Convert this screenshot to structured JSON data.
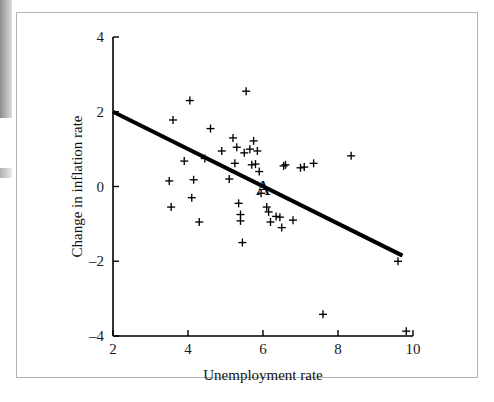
{
  "figure": {
    "background_color": "#ffffff",
    "frame_color": "#b3b3b3",
    "ink_color": "#000000"
  },
  "labels": {
    "x_axis_title": "Unemployment rate",
    "y_axis_title": "Change in inflation rate",
    "annotation_a": "A",
    "x_ticks": [
      "2",
      "4",
      "6",
      "8",
      "10"
    ],
    "y_ticks": [
      "-4",
      "-2",
      "0",
      "2",
      "4"
    ]
  },
  "chart_data": {
    "type": "scatter",
    "title": "",
    "xlabel": "Unemployment rate",
    "ylabel": "Change in inflation rate",
    "xlim": [
      2,
      10
    ],
    "ylim": [
      -4,
      4
    ],
    "xticks": [
      2,
      4,
      6,
      8,
      10
    ],
    "yticks": [
      -4,
      -2,
      0,
      2,
      4
    ],
    "grid": false,
    "legend": "none",
    "marker": "plus",
    "marker_color": "#000000",
    "annotations": [
      {
        "text": "A",
        "x": 6.0,
        "y": -0.05,
        "note": "labelled observation on the fitted line"
      }
    ],
    "fit_line": {
      "label": "Phillips curve (fitted regression line)",
      "color": "#000000",
      "width_px": 4,
      "x_start": 2.0,
      "y_start": 2.0,
      "x_end": 9.72,
      "y_end": -1.85,
      "slope": -0.4987,
      "intercept": 2.9974
    },
    "points": [
      {
        "x": 3.5,
        "y": 0.15
      },
      {
        "x": 3.55,
        "y": -0.55
      },
      {
        "x": 3.6,
        "y": 1.78
      },
      {
        "x": 3.9,
        "y": 0.68
      },
      {
        "x": 4.05,
        "y": 2.3
      },
      {
        "x": 4.1,
        "y": -0.3
      },
      {
        "x": 4.15,
        "y": 0.18
      },
      {
        "x": 4.3,
        "y": -0.95
      },
      {
        "x": 4.45,
        "y": 0.75
      },
      {
        "x": 4.6,
        "y": 1.55
      },
      {
        "x": 4.9,
        "y": 0.95
      },
      {
        "x": 5.1,
        "y": 0.2
      },
      {
        "x": 5.2,
        "y": 1.3
      },
      {
        "x": 5.25,
        "y": 0.62
      },
      {
        "x": 5.3,
        "y": 1.05
      },
      {
        "x": 5.35,
        "y": -0.45
      },
      {
        "x": 5.4,
        "y": -0.75
      },
      {
        "x": 5.4,
        "y": -0.92
      },
      {
        "x": 5.45,
        "y": -1.5
      },
      {
        "x": 5.5,
        "y": 0.9
      },
      {
        "x": 5.55,
        "y": 2.55
      },
      {
        "x": 5.65,
        "y": 1.0
      },
      {
        "x": 5.7,
        "y": 0.58
      },
      {
        "x": 5.75,
        "y": 1.22
      },
      {
        "x": 5.8,
        "y": 0.6
      },
      {
        "x": 5.85,
        "y": 0.95
      },
      {
        "x": 5.9,
        "y": 0.4
      },
      {
        "x": 5.95,
        "y": -0.18
      },
      {
        "x": 6.1,
        "y": -0.55
      },
      {
        "x": 6.15,
        "y": -0.68
      },
      {
        "x": 6.2,
        "y": -0.95
      },
      {
        "x": 6.35,
        "y": -0.8
      },
      {
        "x": 6.45,
        "y": -0.82
      },
      {
        "x": 6.5,
        "y": -1.1
      },
      {
        "x": 6.55,
        "y": 0.55
      },
      {
        "x": 6.6,
        "y": 0.58
      },
      {
        "x": 6.8,
        "y": -0.9
      },
      {
        "x": 7.0,
        "y": 0.5
      },
      {
        "x": 7.1,
        "y": 0.52
      },
      {
        "x": 7.35,
        "y": 0.62
      },
      {
        "x": 7.6,
        "y": -3.42
      },
      {
        "x": 8.35,
        "y": 0.82
      },
      {
        "x": 9.6,
        "y": -2.0
      },
      {
        "x": 9.82,
        "y": -3.87
      }
    ]
  }
}
